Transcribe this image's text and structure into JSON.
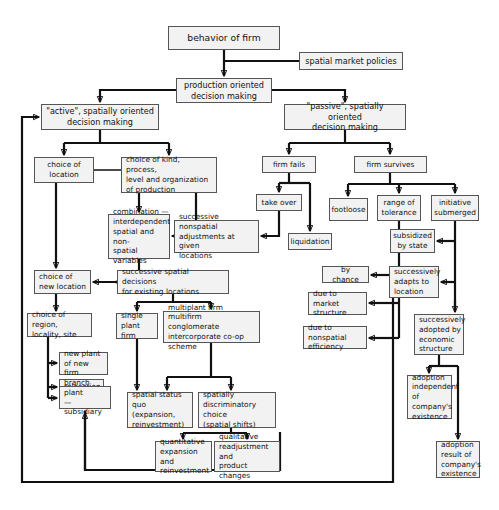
{
  "diagram": {
    "title": "behavior of firm",
    "type": "flowchart",
    "orientation": "top-down",
    "nodes": [
      {
        "id": "behavior_of_firm",
        "label": "behavior of firm",
        "x": 168,
        "y": 26,
        "w": 112,
        "h": 24,
        "size": "big",
        "align": "center"
      },
      {
        "id": "spatial_market_policies",
        "label": "spatial market policies",
        "x": 299,
        "y": 52,
        "w": 104,
        "h": 18,
        "size": "mid",
        "align": "center"
      },
      {
        "id": "production_oriented",
        "label": "production oriented\ndecision making",
        "x": 176,
        "y": 78,
        "w": 96,
        "h": 25,
        "size": "mid",
        "align": "center"
      },
      {
        "id": "active_decision",
        "label": "\"active\", spatially oriented\ndecision making",
        "x": 41,
        "y": 104,
        "w": 118,
        "h": 26,
        "size": "mid",
        "align": "center"
      },
      {
        "id": "passive_decision",
        "label": "\"passive\", spatially oriented\ndecision making",
        "x": 284,
        "y": 104,
        "w": 122,
        "h": 26,
        "size": "mid",
        "align": "center"
      },
      {
        "id": "choice_of_location",
        "label": "choice of\nlocation",
        "x": 34,
        "y": 157,
        "w": 60,
        "h": 26,
        "align": "center"
      },
      {
        "id": "choice_of_kind",
        "label": "choice of kind, process,\nlevel and organization\nof production",
        "x": 121,
        "y": 157,
        "w": 96,
        "h": 36,
        "align": "left"
      },
      {
        "id": "combination",
        "label": "combination —\ninterdependent\nspatial and non-\nspatial variables",
        "x": 108,
        "y": 214,
        "w": 62,
        "h": 45,
        "align": "left"
      },
      {
        "id": "successive_nonspatial",
        "label": "successive nonspatial\nadjustments at given\nlocations",
        "x": 174,
        "y": 220,
        "w": 85,
        "h": 33,
        "align": "left"
      },
      {
        "id": "firm_fails",
        "label": "firm fails",
        "x": 262,
        "y": 156,
        "w": 54,
        "h": 17,
        "align": "center"
      },
      {
        "id": "firm_survives",
        "label": "firm survives",
        "x": 354,
        "y": 156,
        "w": 73,
        "h": 17,
        "align": "center"
      },
      {
        "id": "take_over",
        "label": "take over",
        "x": 256,
        "y": 194,
        "w": 46,
        "h": 17,
        "align": "center"
      },
      {
        "id": "liquidation",
        "label": "liquidation",
        "x": 288,
        "y": 233,
        "w": 44,
        "h": 17,
        "align": "center"
      },
      {
        "id": "footloose",
        "label": "footloose",
        "x": 329,
        "y": 198,
        "w": 39,
        "h": 23,
        "align": "center"
      },
      {
        "id": "range_of_tolerance",
        "label": "range of\ntolerance",
        "x": 377,
        "y": 195,
        "w": 44,
        "h": 26,
        "align": "center"
      },
      {
        "id": "initiative_submerged",
        "label": "initiative\nsubmerged",
        "x": 431,
        "y": 195,
        "w": 48,
        "h": 26,
        "align": "center"
      },
      {
        "id": "subsidized_by_state",
        "label": "subsidized\nby state",
        "x": 390,
        "y": 229,
        "w": 45,
        "h": 24,
        "align": "center"
      },
      {
        "id": "choice_of_new_location",
        "label": "choice of\nnew location",
        "x": 34,
        "y": 270,
        "w": 57,
        "h": 24,
        "align": "left"
      },
      {
        "id": "successive_spatial",
        "label": "successive spatial decisions\nfor existing locations",
        "x": 117,
        "y": 270,
        "w": 112,
        "h": 24,
        "align": "left"
      },
      {
        "id": "by_chance",
        "label": "by chance",
        "x": 322,
        "y": 266,
        "w": 47,
        "h": 17,
        "align": "center"
      },
      {
        "id": "successively_adapts",
        "label": "successively\nadapts to\nlocation",
        "x": 389,
        "y": 266,
        "w": 50,
        "h": 32,
        "align": "left"
      },
      {
        "id": "choice_of_region",
        "label": "choice of region,\nlocality, site",
        "x": 27,
        "y": 313,
        "w": 65,
        "h": 24,
        "align": "left"
      },
      {
        "id": "single_plant_firm",
        "label": "single\nplant firm",
        "x": 116,
        "y": 313,
        "w": 42,
        "h": 26,
        "align": "left"
      },
      {
        "id": "multiplant_firm",
        "label": "multiplant firm\nmultifirm conglomerate\nintercorporate co-op scheme",
        "x": 163,
        "y": 311,
        "w": 97,
        "h": 32,
        "align": "left"
      },
      {
        "id": "due_to_market",
        "label": "due to market\nstructure",
        "x": 308,
        "y": 292,
        "w": 59,
        "h": 23,
        "align": "left"
      },
      {
        "id": "successively_adopted",
        "label": "successively\nadopted by\neconomic\nstructure",
        "x": 414,
        "y": 314,
        "w": 50,
        "h": 41,
        "align": "left"
      },
      {
        "id": "due_to_nonspatial",
        "label": "due to nonspatial\nefficiency",
        "x": 303,
        "y": 326,
        "w": 64,
        "h": 23,
        "align": "left"
      },
      {
        "id": "new_plant",
        "label": "new plant\nof new firm",
        "x": 59,
        "y": 352,
        "w": 49,
        "h": 23,
        "align": "left"
      },
      {
        "id": "relocation",
        "label": "relocation",
        "x": 59,
        "y": 379,
        "w": 45,
        "h": 16,
        "align": "left"
      },
      {
        "id": "branch_plant",
        "label": "branch plant\n— subsidiary",
        "x": 59,
        "y": 386,
        "w": 52,
        "h": 23,
        "align": "left"
      },
      {
        "id": "spatial_status_quo",
        "label": "spatial status quo\n(expansion,\nreinvestment)",
        "x": 127,
        "y": 392,
        "w": 66,
        "h": 36,
        "align": "left"
      },
      {
        "id": "spatially_discriminatory",
        "label": "spatially\ndiscriminatory choice\n(spatial shifts)",
        "x": 198,
        "y": 392,
        "w": 78,
        "h": 36,
        "align": "left"
      },
      {
        "id": "adoption_independent",
        "label": "adoption\nindependent\nof\ncompany's\nexistence",
        "x": 407,
        "y": 375,
        "w": 45,
        "h": 44,
        "align": "left"
      },
      {
        "id": "quantitative_expansion",
        "label": "quantitative\nexpansion and\nreinvestment",
        "x": 155,
        "y": 441,
        "w": 57,
        "h": 31,
        "align": "left"
      },
      {
        "id": "qualitative_readjustment",
        "label": "qualitative\nreadjustment and\nproduct changes",
        "x": 214,
        "y": 441,
        "w": 66,
        "h": 31,
        "align": "left"
      },
      {
        "id": "adoption_result",
        "label": "adoption\nresult of\ncompany's\nexistence",
        "x": 436,
        "y": 441,
        "w": 44,
        "h": 37,
        "align": "left"
      }
    ],
    "edges": [
      {
        "id": "e-behavior-production",
        "from": "behavior_of_firm",
        "to": "production_oriented",
        "kind": "arrow"
      },
      {
        "id": "e-policies-production",
        "from": "spatial_market_policies",
        "to": "production_oriented",
        "kind": "line"
      },
      {
        "id": "e-production-active",
        "from": "production_oriented",
        "to": "active_decision",
        "kind": "arrow"
      },
      {
        "id": "e-production-passive",
        "from": "production_oriented",
        "to": "passive_decision",
        "kind": "arrow"
      },
      {
        "id": "e-active-choiceloc",
        "from": "active_decision",
        "to": "choice_of_location",
        "kind": "arrow"
      },
      {
        "id": "e-active-choicekind",
        "from": "active_decision",
        "to": "choice_of_kind",
        "kind": "arrow"
      },
      {
        "id": "e-choicekind-combination",
        "from": "choice_of_kind",
        "to": "combination",
        "kind": "arrow"
      },
      {
        "id": "e-choicekind-nonspatial",
        "from": "choice_of_kind",
        "to": "successive_nonspatial",
        "kind": "arrow"
      },
      {
        "id": "e-passive-fails",
        "from": "passive_decision",
        "to": "firm_fails",
        "kind": "arrow"
      },
      {
        "id": "e-passive-survives",
        "from": "passive_decision",
        "to": "firm_survives",
        "kind": "arrow"
      },
      {
        "id": "e-fails-takeover",
        "from": "firm_fails",
        "to": "take_over",
        "kind": "arrow"
      },
      {
        "id": "e-fails-liquidation",
        "from": "firm_fails",
        "to": "liquidation",
        "kind": "arrow"
      },
      {
        "id": "e-takeover-nonspatial",
        "from": "take_over",
        "to": "successive_nonspatial",
        "kind": "arrow"
      },
      {
        "id": "e-survives-footloose",
        "from": "firm_survives",
        "to": "footloose",
        "kind": "arrow"
      },
      {
        "id": "e-survives-range",
        "from": "firm_survives",
        "to": "range_of_tolerance",
        "kind": "arrow"
      },
      {
        "id": "e-survives-initiative",
        "from": "firm_survives",
        "to": "initiative_submerged",
        "kind": "arrow"
      },
      {
        "id": "e-initiative-subsidized",
        "from": "initiative_submerged",
        "to": "subsidized_by_state",
        "kind": "arrow"
      },
      {
        "id": "e-initiative-adapts",
        "from": "initiative_submerged",
        "to": "successively_adapts",
        "kind": "arrow"
      },
      {
        "id": "e-initiative-adopted",
        "from": "initiative_submerged",
        "to": "successively_adopted",
        "kind": "arrow"
      },
      {
        "id": "e-range-bychance",
        "from": "range_of_tolerance",
        "to": "by_chance",
        "kind": "arrow"
      },
      {
        "id": "e-range-market",
        "from": "range_of_tolerance",
        "to": "due_to_market",
        "kind": "arrow"
      },
      {
        "id": "e-range-nonspatial-eff",
        "from": "range_of_tolerance",
        "to": "due_to_nonspatial",
        "kind": "arrow"
      },
      {
        "id": "e-choiceloc-newloc",
        "from": "choice_of_location",
        "to": "choice_of_new_location",
        "kind": "arrow"
      },
      {
        "id": "e-combination-successive",
        "from": "combination",
        "to": "successive_spatial",
        "kind": "arrow"
      },
      {
        "id": "e-successive-newloc",
        "from": "successive_spatial",
        "to": "choice_of_new_location",
        "kind": "arrow"
      },
      {
        "id": "e-newloc-region",
        "from": "choice_of_new_location",
        "to": "choice_of_region",
        "kind": "arrow"
      },
      {
        "id": "e-region-newplant",
        "from": "choice_of_region",
        "to": "new_plant",
        "kind": "arrow"
      },
      {
        "id": "e-region-relocation",
        "from": "choice_of_region",
        "to": "relocation",
        "kind": "arrow"
      },
      {
        "id": "e-region-branch",
        "from": "choice_of_region",
        "to": "branch_plant",
        "kind": "arrow"
      },
      {
        "id": "e-successive-single",
        "from": "successive_spatial",
        "to": "single_plant_firm",
        "kind": "arrow"
      },
      {
        "id": "e-successive-multi",
        "from": "successive_spatial",
        "to": "multiplant_firm",
        "kind": "arrow"
      },
      {
        "id": "e-single-status",
        "from": "single_plant_firm",
        "to": "spatial_status_quo",
        "kind": "arrow"
      },
      {
        "id": "e-multi-status",
        "from": "multiplant_firm",
        "to": "spatial_status_quo",
        "kind": "arrow"
      },
      {
        "id": "e-multi-discriminatory",
        "from": "multiplant_firm",
        "to": "spatially_discriminatory",
        "kind": "arrow"
      },
      {
        "id": "e-discr-quantitative",
        "from": "spatially_discriminatory",
        "to": "quantitative_expansion",
        "kind": "arrow"
      },
      {
        "id": "e-discr-qualitative",
        "from": "spatially_discriminatory",
        "to": "qualitative_readjustment",
        "kind": "arrow"
      },
      {
        "id": "e-adapts-feedback",
        "from": "successively_adapts",
        "to": "active_decision",
        "kind": "arrow"
      },
      {
        "id": "e-adopted-independent",
        "from": "successively_adopted",
        "to": "adoption_independent",
        "kind": "arrow"
      },
      {
        "id": "e-adopted-result",
        "from": "successively_adopted",
        "to": "adoption_result",
        "kind": "arrow"
      },
      {
        "id": "e-branch-feedback",
        "from": "spatial_status_quo",
        "to": "branch_plant",
        "kind": "arrow"
      }
    ]
  }
}
